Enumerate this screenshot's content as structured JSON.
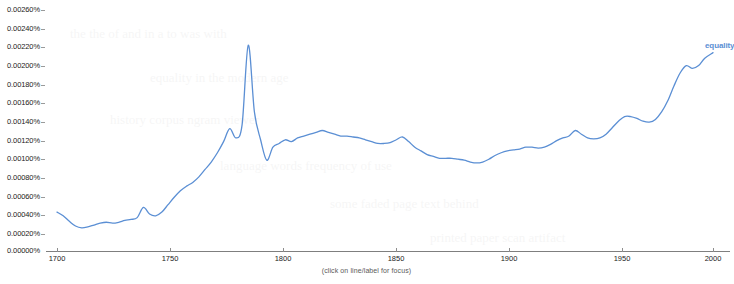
{
  "caption": "(click on line/label for focus)",
  "series_label": "equality",
  "colors": {
    "line": "#5b8fd4",
    "axis": "#7f7f7f",
    "tick": "#9a9a9a",
    "label": "#222222",
    "caption": "#5a5a5a"
  },
  "chart_data": {
    "type": "line",
    "title": "",
    "subtitle": "",
    "xlabel": "",
    "ylabel": "",
    "grid": false,
    "legend_position": "right-of-line-end",
    "xlim": [
      1700,
      2019
    ],
    "ylim": [
      0.0,
      0.0026
    ],
    "xticks": [
      1700,
      1750,
      1800,
      1850,
      1900,
      1950,
      2000
    ],
    "xticklabels": [
      "1700",
      "1750",
      "1800",
      "1850",
      "1900",
      "1950",
      "2000"
    ],
    "yticks": [
      0.0,
      0.0002,
      0.0004,
      0.0006,
      0.0008,
      0.001,
      0.0012,
      0.0014,
      0.0016,
      0.0018,
      0.002,
      0.0022,
      0.0024,
      0.0026
    ],
    "yticklabels": [
      "0.00000%",
      "0.00020%",
      "0.00040%",
      "0.00060%",
      "0.00080%",
      "0.00100%",
      "0.00120%",
      "0.00140%",
      "0.00160%",
      "0.00180%",
      "0.00200%",
      "0.00220%",
      "0.00240%",
      "0.00260%"
    ],
    "units": "percent",
    "series": [
      {
        "name": "equality",
        "color": "#5b8fd4",
        "x": [
          1700,
          1703,
          1706,
          1709,
          1712,
          1715,
          1718,
          1721,
          1724,
          1727,
          1730,
          1733,
          1736,
          1739,
          1742,
          1745,
          1748,
          1751,
          1754,
          1757,
          1760,
          1763,
          1766,
          1769,
          1772,
          1775,
          1778,
          1781,
          1784,
          1787,
          1790,
          1793,
          1796,
          1799,
          1802,
          1805,
          1808,
          1811,
          1814,
          1817,
          1820,
          1823,
          1826,
          1829,
          1832,
          1835,
          1838,
          1841,
          1844,
          1847,
          1850,
          1853,
          1856,
          1859,
          1862,
          1865,
          1868,
          1871,
          1874,
          1877,
          1880,
          1883,
          1886,
          1889,
          1892,
          1895,
          1898,
          1901,
          1904,
          1907,
          1910,
          1913,
          1916,
          1919,
          1922,
          1925,
          1928,
          1931,
          1934,
          1937,
          1940,
          1943,
          1946,
          1949,
          1952,
          1955,
          1958,
          1961,
          1964,
          1967,
          1970,
          1973,
          1976,
          1979,
          1982,
          1985,
          1988,
          1991,
          1994,
          1997,
          2000,
          2003,
          2006,
          2009,
          2012,
          2015,
          2019
        ],
        "y": [
          0.00042,
          0.00038,
          0.00032,
          0.00027,
          0.00025,
          0.00026,
          0.00028,
          0.0003,
          0.00031,
          0.0003,
          0.00031,
          0.00033,
          0.00034,
          0.00036,
          0.00047,
          0.0004,
          0.00038,
          0.00042,
          0.0005,
          0.00058,
          0.00065,
          0.0007,
          0.00074,
          0.0008,
          0.00088,
          0.00096,
          0.00106,
          0.00118,
          0.00132,
          0.00122,
          0.00136,
          0.00222,
          0.0015,
          0.0012,
          0.00098,
          0.00112,
          0.00116,
          0.0012,
          0.00118,
          0.00122,
          0.00124,
          0.00126,
          0.00128,
          0.0013,
          0.00128,
          0.00126,
          0.00124,
          0.00124,
          0.00123,
          0.00122,
          0.0012,
          0.00118,
          0.00116,
          0.00116,
          0.00117,
          0.0012,
          0.00123,
          0.00118,
          0.00112,
          0.00108,
          0.00104,
          0.00102,
          0.001,
          0.001,
          0.001,
          0.00099,
          0.00098,
          0.00096,
          0.00095,
          0.00096,
          0.00099,
          0.00103,
          0.00106,
          0.00108,
          0.00109,
          0.0011,
          0.00112,
          0.00112,
          0.00111,
          0.00112,
          0.00115,
          0.00119,
          0.00122,
          0.00124,
          0.0013,
          0.00126,
          0.00122,
          0.00121,
          0.00122,
          0.00126,
          0.00133,
          0.0014,
          0.00145,
          0.00145,
          0.00143,
          0.0014,
          0.00139,
          0.00142,
          0.0015,
          0.00162,
          0.00178,
          0.00192,
          0.002,
          0.00197,
          0.002,
          0.00208,
          0.00214
        ]
      }
    ]
  },
  "background_text_lines": [
    "the the of and in a to was with",
    "equality in the modern age",
    "history corpus ngram viewer",
    "language words frequency of use",
    "some faded page text behind",
    "printed paper scan artifact"
  ]
}
